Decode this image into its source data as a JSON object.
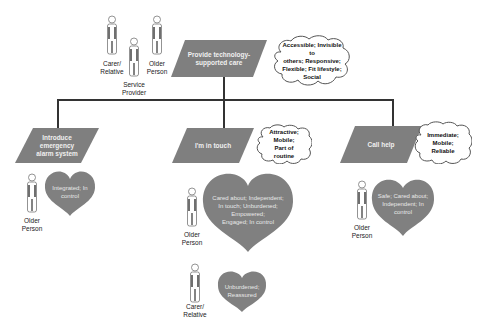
{
  "colors": {
    "parallelogram_fill": "#7f7f7f",
    "heart_fill": "#808080",
    "cloud_fill": "#ffffff",
    "cloud_stroke": "#555555",
    "connector": "#333333",
    "person_stroke": "#777777",
    "person_dark": "#333333"
  },
  "root": {
    "goal": "Provide technology-supported care",
    "qualities": "Accessible; Invisible to others; Responsive; Flexible; Fit lifestyle; Social",
    "stakeholders": [
      {
        "label_line1": "Carer/",
        "label_line2": "Relative"
      },
      {
        "label_line1": "Service",
        "label_line2": "Provider"
      },
      {
        "label_line1": "Older",
        "label_line2": "Person"
      }
    ]
  },
  "branches": [
    {
      "goal_line1": "Introduce emergency",
      "goal_line2": "alarm system",
      "qualities": "",
      "feelings": [
        {
          "actor_line1": "Older",
          "actor_line2": "Person",
          "text": "Integrated; In control"
        }
      ]
    },
    {
      "goal_line1": "I'm in touch",
      "goal_line2": "",
      "qualities": "Attractive; Mobile; Part of routine",
      "feelings": [
        {
          "actor_line1": "Older",
          "actor_line2": "Person",
          "text_lines": [
            "Cared about; Independent;",
            "In touch; Unburdened;",
            "Empowered;",
            "Engaged; In control"
          ]
        },
        {
          "actor_line1": "Carer/",
          "actor_line2": "Relative",
          "text_lines": [
            "Unburdened;",
            "Reassured"
          ]
        }
      ]
    },
    {
      "goal_line1": "Call help",
      "goal_line2": "",
      "qualities": "Immediate; Mobile; Reliable",
      "feelings": [
        {
          "actor_line1": "Older",
          "actor_line2": "Person",
          "text_lines": [
            "Safe; Cared about;",
            "Independent; In",
            "control"
          ]
        }
      ]
    }
  ],
  "text": {
    "b0_heart_l1": "Integrated; In",
    "b0_heart_l2": "control",
    "root_q_l1": "Accessible; Invisible to",
    "root_q_l2": "others; Responsive;",
    "root_q_l3": "Flexible; Fit lifestyle;",
    "root_q_l4": "Social",
    "root_goal_l1": "Provide technology-",
    "root_goal_l2": "supported care",
    "b1_q_l1": "Attractive; Mobile;",
    "b1_q_l2": "Part of routine",
    "b2_q_l1": "Immediate;",
    "b2_q_l2": "Mobile; Reliable"
  }
}
